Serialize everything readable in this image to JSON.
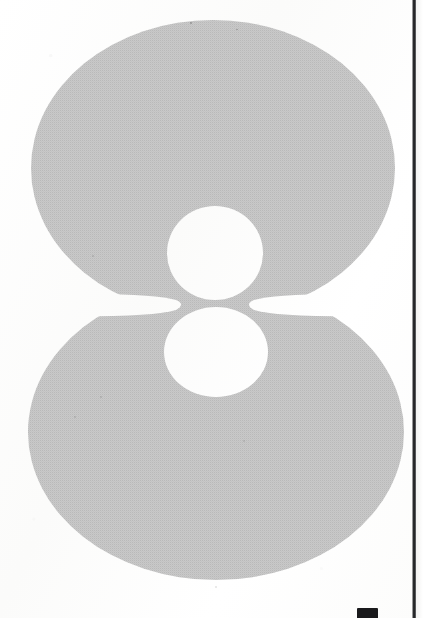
{
  "page": {
    "kind": "scanned-printed-page",
    "width": 423,
    "height": 618,
    "paper_color": "#fcfcfb",
    "caption": ""
  },
  "glyph": {
    "character": "8",
    "description": "large numeral eight",
    "fill_color": "#c9c9c9",
    "rendering": "halftone screen",
    "bleed": "top edge cropped",
    "geometry": {
      "upper_bowl": {
        "cx": 213,
        "cy": 168,
        "rx": 182,
        "ry": 148
      },
      "lower_bowl": {
        "cx": 216,
        "cy": 432,
        "rx": 188,
        "ry": 148
      },
      "upper_counter": {
        "cx": 215,
        "cy": 253,
        "rx": 48,
        "ry": 47
      },
      "lower_counter": {
        "cx": 216,
        "cy": 352,
        "rx": 52,
        "ry": 45
      },
      "waist_y": 305,
      "top_y": 25,
      "bottom_y": 578,
      "left_x": 30,
      "right_x": 405
    }
  },
  "scan_edge": {
    "name": "page gutter shadow",
    "color": "#1d1e20",
    "x": 412,
    "width": 4
  },
  "bottom_mark": {
    "name": "clipped glyph at bottom margin",
    "color": "#1a1a1c",
    "x": 357,
    "y": 608
  },
  "chart_data": null
}
